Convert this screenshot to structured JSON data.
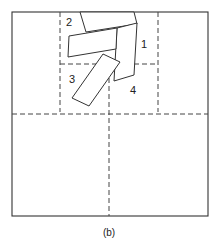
{
  "figure": {
    "caption": "(b)",
    "colors": {
      "stroke": "#333333",
      "background": "#ffffff"
    },
    "regions": [
      {
        "id": "region-1",
        "label": "1"
      },
      {
        "id": "region-2",
        "label": "2"
      },
      {
        "id": "region-3",
        "label": "3"
      },
      {
        "id": "region-4",
        "label": "4"
      }
    ]
  }
}
